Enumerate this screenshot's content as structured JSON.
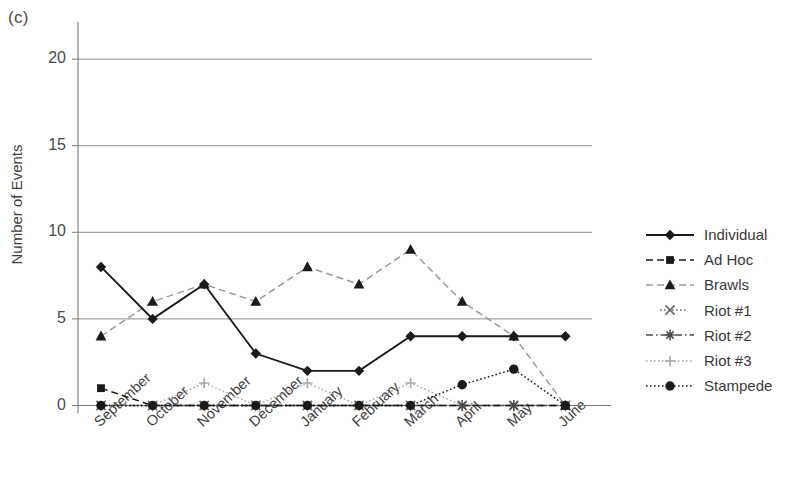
{
  "panel_label": "(c)",
  "axis": {
    "y_title": "Number of Events",
    "y_ticks": [
      "0",
      "5",
      "10",
      "15",
      "20"
    ],
    "x_ticks": [
      "September",
      "October",
      "November",
      "December",
      "January",
      "February",
      "March",
      "April",
      "May",
      "June"
    ]
  },
  "legend": {
    "items": [
      {
        "label": "Individual",
        "marker": "diamond",
        "line": "solid"
      },
      {
        "label": "Ad Hoc",
        "marker": "square",
        "line": "dashed"
      },
      {
        "label": "Brawls",
        "marker": "triangle",
        "line": "dashed"
      },
      {
        "label": "Riot #1",
        "marker": "cross-x",
        "line": "dotted"
      },
      {
        "label": "Riot #2",
        "marker": "asterisk",
        "line": "dash-dot"
      },
      {
        "label": "Riot #3",
        "marker": "plus",
        "line": "dotted"
      },
      {
        "label": "Stampede",
        "marker": "circle",
        "line": "dotted"
      }
    ]
  },
  "chart_data": {
    "type": "line",
    "title": "",
    "xlabel": "",
    "ylabel": "Number of Events",
    "ylim": [
      0,
      21
    ],
    "yticks": [
      0,
      5,
      10,
      15,
      20
    ],
    "grid": "horizontal",
    "legend_position": "right",
    "categories": [
      "September",
      "October",
      "November",
      "December",
      "January",
      "February",
      "March",
      "April",
      "May",
      "June"
    ],
    "series": [
      {
        "name": "Individual",
        "marker": "diamond",
        "line": "solid",
        "color": "#1a1a1a",
        "values": [
          8,
          5,
          7,
          3,
          2,
          2,
          4,
          4,
          4,
          4
        ]
      },
      {
        "name": "Ad Hoc",
        "marker": "square",
        "line": "dashed",
        "color": "#1a1a1a",
        "values": [
          1,
          0,
          0,
          0,
          0,
          0,
          0,
          0,
          0,
          0
        ]
      },
      {
        "name": "Brawls",
        "marker": "triangle",
        "line": "dashed",
        "color": "#9a9a9a",
        "values": [
          4,
          6,
          7,
          6,
          8,
          7,
          9,
          6,
          4,
          0
        ]
      },
      {
        "name": "Riot #1",
        "marker": "cross-x",
        "line": "dotted",
        "color": "#6a6a6a",
        "values": [
          0,
          0,
          0,
          0,
          0,
          0,
          0,
          0,
          0,
          0
        ]
      },
      {
        "name": "Riot #2",
        "marker": "asterisk",
        "line": "dash-dot",
        "color": "#4a4a4a",
        "values": [
          0,
          0,
          0,
          0,
          0,
          0,
          0,
          0,
          0,
          0
        ]
      },
      {
        "name": "Riot #3",
        "marker": "plus",
        "line": "dotted",
        "color": "#a8a8a8",
        "values": [
          0,
          0,
          1.3,
          0,
          1.3,
          0,
          1.3,
          0,
          0,
          0
        ]
      },
      {
        "name": "Stampede",
        "marker": "circle",
        "line": "dotted",
        "color": "#1a1a1a",
        "values": [
          0,
          0,
          0,
          0,
          0,
          0,
          0,
          1.2,
          2.1,
          0
        ]
      }
    ]
  }
}
